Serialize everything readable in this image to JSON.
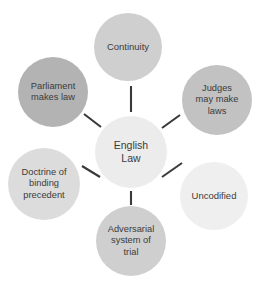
{
  "diagram": {
    "type": "hub-and-spoke concept map",
    "title": "English Law",
    "center": {
      "id": "english-law",
      "label": "English\nLaw",
      "color": "#ececec"
    },
    "nodes": [
      {
        "id": "continuity",
        "label": "Continuity",
        "position": "top",
        "color": "#cfcfcf"
      },
      {
        "id": "parliament-makes-law",
        "label": "Parliament\nmakes law",
        "position": "top-left",
        "color": "#b3b3b3"
      },
      {
        "id": "judges-may-make-laws",
        "label": "Judges\nmay make\nlaws",
        "position": "top-right",
        "color": "#c2c2c2"
      },
      {
        "id": "doctrine-of-binding-precedent",
        "label": "Doctrine of\nbinding\nprecedent",
        "position": "bottom-left",
        "color": "#dcdcdc"
      },
      {
        "id": "uncodified",
        "label": "Uncodified",
        "position": "bottom-right",
        "color": "#efefef"
      },
      {
        "id": "adversarial-system-of-trial",
        "label": "Adversarial\nsystem of\ntrial",
        "position": "bottom",
        "color": "#cfcfcf"
      }
    ],
    "connector_color": "#3a3a3a",
    "background_color": "#ffffff",
    "text_color": "#3b3b3b"
  }
}
